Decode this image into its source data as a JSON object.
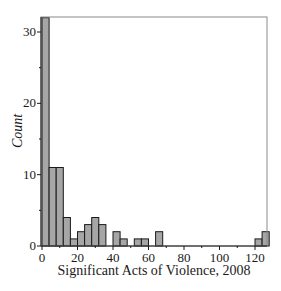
{
  "chart_data": {
    "type": "bar",
    "subtype": "histogram",
    "title": "",
    "xlabel": "Significant Acts of Violence, 2008",
    "ylabel": "Count",
    "bin_width": 4,
    "bin_start": 0,
    "bins": [
      {
        "from": 0,
        "to": 4,
        "count": 32
      },
      {
        "from": 4,
        "to": 8,
        "count": 11
      },
      {
        "from": 8,
        "to": 12,
        "count": 11
      },
      {
        "from": 12,
        "to": 16,
        "count": 4
      },
      {
        "from": 16,
        "to": 20,
        "count": 1
      },
      {
        "from": 20,
        "to": 24,
        "count": 2
      },
      {
        "from": 24,
        "to": 28,
        "count": 3
      },
      {
        "from": 28,
        "to": 32,
        "count": 4
      },
      {
        "from": 32,
        "to": 36,
        "count": 3
      },
      {
        "from": 36,
        "to": 40,
        "count": 0
      },
      {
        "from": 40,
        "to": 44,
        "count": 2
      },
      {
        "from": 44,
        "to": 48,
        "count": 1
      },
      {
        "from": 48,
        "to": 52,
        "count": 0
      },
      {
        "from": 52,
        "to": 56,
        "count": 1
      },
      {
        "from": 56,
        "to": 60,
        "count": 1
      },
      {
        "from": 60,
        "to": 64,
        "count": 0
      },
      {
        "from": 64,
        "to": 68,
        "count": 2
      },
      {
        "from": 68,
        "to": 72,
        "count": 0
      },
      {
        "from": 72,
        "to": 76,
        "count": 0
      },
      {
        "from": 76,
        "to": 80,
        "count": 0
      },
      {
        "from": 80,
        "to": 84,
        "count": 0
      },
      {
        "from": 84,
        "to": 88,
        "count": 0
      },
      {
        "from": 88,
        "to": 92,
        "count": 0
      },
      {
        "from": 92,
        "to": 96,
        "count": 0
      },
      {
        "from": 96,
        "to": 100,
        "count": 0
      },
      {
        "from": 100,
        "to": 104,
        "count": 0
      },
      {
        "from": 104,
        "to": 108,
        "count": 0
      },
      {
        "from": 108,
        "to": 112,
        "count": 0
      },
      {
        "from": 112,
        "to": 116,
        "count": 0
      },
      {
        "from": 116,
        "to": 120,
        "count": 0
      },
      {
        "from": 120,
        "to": 124,
        "count": 1
      },
      {
        "from": 124,
        "to": 128,
        "count": 2
      }
    ],
    "xlim": [
      0,
      128
    ],
    "ylim": [
      0,
      32
    ],
    "xticks": [
      0,
      20,
      40,
      60,
      80,
      100,
      120
    ],
    "yticks": [
      0,
      10,
      20,
      30
    ],
    "grid": false,
    "legend": null,
    "bar_color": "#a6a6a6",
    "bar_edge_color": "#1a1a1a"
  }
}
